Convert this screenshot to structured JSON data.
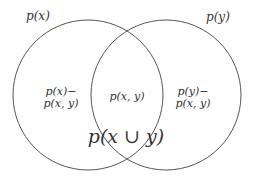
{
  "diagram": {
    "type": "venn",
    "sets": [
      {
        "id": "x",
        "label": "p(x)"
      },
      {
        "id": "y",
        "label": "p(y)"
      }
    ],
    "regions": {
      "left_only": {
        "line1": "p(x)−",
        "line2": "p(x, y)"
      },
      "intersection": {
        "label": "p(x, y)"
      },
      "right_only": {
        "line1": "p(y)−",
        "line2": "p(x, y)"
      }
    },
    "union_label": "p(x ∪ y)",
    "colors": {
      "stroke": "#555555",
      "text": "#333333",
      "background": "#ffffff"
    }
  }
}
